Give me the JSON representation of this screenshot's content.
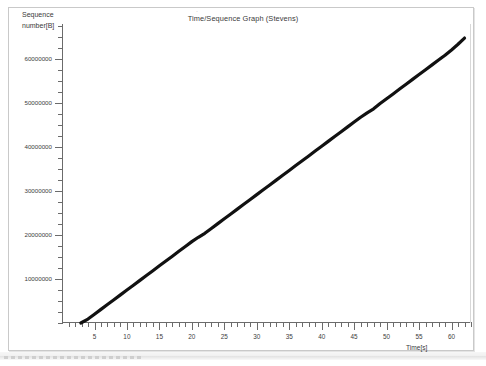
{
  "window": {
    "frame_color": "#c9c9c9",
    "background": "#ffffff"
  },
  "chart_header": {
    "title": "Time/Sequence Graph (Stevens)",
    "marker_glyph": "·"
  },
  "axes": {
    "y_label_line1": "Sequence",
    "y_label_line2": "number[B]",
    "x_label": "Time[s]"
  },
  "chart_data": {
    "type": "line",
    "title": "Time/Sequence Graph (Stevens)",
    "xlabel": "Time[s]",
    "ylabel": "Sequence number[B]",
    "grid": false,
    "legend": null,
    "line_color": "#111111",
    "line_width": 3.2,
    "xlim": [
      0,
      63
    ],
    "ylim": [
      0,
      68000000
    ],
    "x_ticks_major": [
      5,
      10,
      15,
      20,
      25,
      30,
      35,
      40,
      45,
      50,
      55,
      60
    ],
    "x_tick_labels": [
      "5",
      "10",
      "15",
      "20",
      "25",
      "30",
      "35",
      "40",
      "45",
      "50",
      "55",
      "60"
    ],
    "x_tick_minor_step": 1,
    "y_ticks_major": [
      10000000,
      20000000,
      30000000,
      40000000,
      50000000,
      60000000
    ],
    "y_tick_labels": [
      "10000000",
      "20000000",
      "30000000",
      "40000000",
      "50000000",
      "60000000"
    ],
    "y_tick_minor_step": 2500000,
    "series": [
      {
        "name": "tcp sequence number",
        "x": [
          2.9,
          4.0,
          5.0,
          6.0,
          7.0,
          8.0,
          9.0,
          10.0,
          11.0,
          12.0,
          13.0,
          14.0,
          15.0,
          16.0,
          17.0,
          18.0,
          19.0,
          20.0,
          21.0,
          22.0,
          23.0,
          24.0,
          25.0,
          26.0,
          27.0,
          28.0,
          29.0,
          30.0,
          31.0,
          32.0,
          33.0,
          34.0,
          35.0,
          36.0,
          37.0,
          38.0,
          39.0,
          40.0,
          41.0,
          42.0,
          43.0,
          44.0,
          45.0,
          46.0,
          47.0,
          48.0,
          49.0,
          50.0,
          51.0,
          52.0,
          53.0,
          54.0,
          55.0,
          56.0,
          57.0,
          58.0,
          59.0,
          60.0,
          61.0,
          62.0
        ],
        "y": [
          0,
          900000,
          2000000,
          3100000,
          4200000,
          5300000,
          6400000,
          7500000,
          8600000,
          9700000,
          10800000,
          11900000,
          13000000,
          14100000,
          15200000,
          16300000,
          17400000,
          18500000,
          19500000,
          20400000,
          21500000,
          22600000,
          23700000,
          24800000,
          25900000,
          27000000,
          28100000,
          29200000,
          30300000,
          31400000,
          32500000,
          33600000,
          34700000,
          35800000,
          36900000,
          38000000,
          39100000,
          40200000,
          41300000,
          42400000,
          43500000,
          44600000,
          45700000,
          46800000,
          47800000,
          48700000,
          49900000,
          51000000,
          52100000,
          53200000,
          54300000,
          55400000,
          56500000,
          57600000,
          58700000,
          59800000,
          60900000,
          62100000,
          63400000,
          64800000
        ]
      }
    ]
  }
}
